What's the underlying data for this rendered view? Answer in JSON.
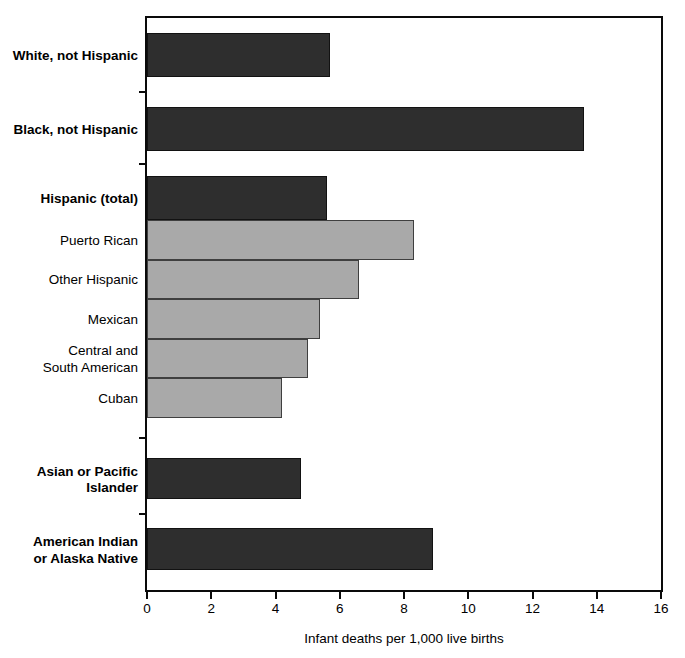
{
  "chart_data": {
    "type": "bar",
    "orientation": "horizontal",
    "title": "",
    "xlabel": "Infant deaths per 1,000 live births",
    "xlim": [
      0,
      16
    ],
    "xticks": [
      0,
      2,
      4,
      6,
      8,
      10,
      12,
      14,
      16
    ],
    "grid": false,
    "legend": false,
    "bars": [
      {
        "label": "White, not Hispanic",
        "value": 5.7,
        "group": "major"
      },
      {
        "label": "Black, not Hispanic",
        "value": 13.6,
        "group": "major"
      },
      {
        "label": "Hispanic (total)",
        "value": 5.6,
        "group": "major"
      },
      {
        "label": "Puerto Rican",
        "value": 8.3,
        "group": "subgroup"
      },
      {
        "label": "Other Hispanic",
        "value": 6.6,
        "group": "subgroup"
      },
      {
        "label": "Mexican",
        "value": 5.4,
        "group": "subgroup"
      },
      {
        "label": "Central and\nSouth American",
        "value": 5.0,
        "group": "subgroup"
      },
      {
        "label": "Cuban",
        "value": 4.2,
        "group": "subgroup"
      },
      {
        "label": "Asian or Pacific\nIslander",
        "value": 4.8,
        "group": "major"
      },
      {
        "label": "American Indian\nor Alaska Native",
        "value": 8.9,
        "group": "major"
      }
    ],
    "colors": {
      "major_bar_fill": "#2e2e2e",
      "subgroup_bar_fill": "#a9a9a9",
      "bar_outline": "#3f3f3f",
      "axis": "#0a0a0a",
      "background": "#ffffff"
    }
  }
}
